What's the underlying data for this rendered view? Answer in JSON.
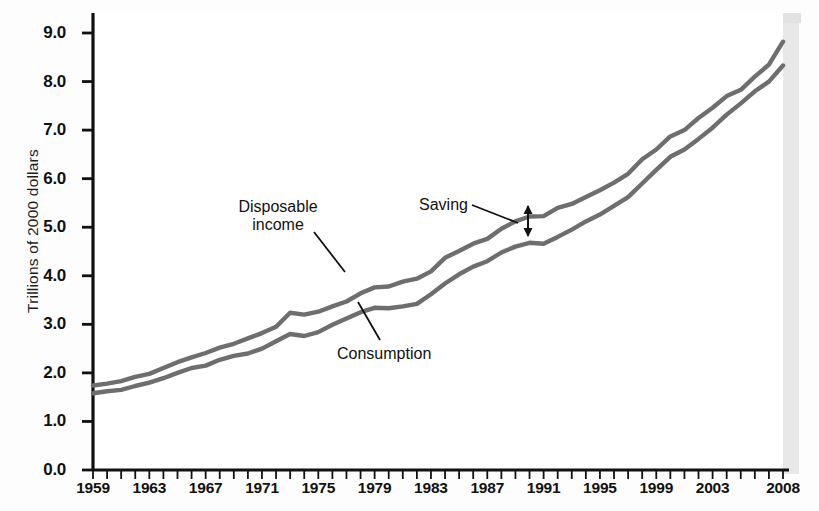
{
  "chart_data": {
    "type": "line",
    "title": "",
    "xlabel": "",
    "ylabel": "Trillions of 2000 dollars",
    "xlim": [
      1959,
      2008
    ],
    "ylim": [
      0.0,
      9.4
    ],
    "grid": false,
    "legend_position": "inline-annotations",
    "ytick_labels": [
      "0.0",
      "1.0",
      "2.0",
      "3.0",
      "4.0",
      "5.0",
      "6.0",
      "7.0",
      "8.0",
      "9.0"
    ],
    "ytick_values": [
      0.0,
      1.0,
      2.0,
      3.0,
      4.0,
      5.0,
      6.0,
      7.0,
      8.0,
      9.0
    ],
    "xtick_labels": [
      "1959",
      "1963",
      "1967",
      "1971",
      "1975",
      "1979",
      "1983",
      "1987",
      "1991",
      "1995",
      "1999",
      "2003",
      "2008"
    ],
    "xtick_values": [
      1959,
      1963,
      1967,
      1971,
      1975,
      1979,
      1983,
      1987,
      1991,
      1995,
      1999,
      2003,
      2008
    ],
    "x": [
      1959,
      1960,
      1961,
      1962,
      1963,
      1964,
      1965,
      1966,
      1967,
      1968,
      1969,
      1970,
      1971,
      1972,
      1973,
      1974,
      1975,
      1976,
      1977,
      1978,
      1979,
      1980,
      1981,
      1982,
      1983,
      1984,
      1985,
      1986,
      1987,
      1988,
      1989,
      1990,
      1991,
      1992,
      1993,
      1994,
      1995,
      1996,
      1997,
      1998,
      1999,
      2000,
      2001,
      2002,
      2003,
      2004,
      2005,
      2006,
      2007,
      2008
    ],
    "series": [
      {
        "name": "Disposable income",
        "color": "#6e6e6e",
        "values": [
          1.74,
          1.78,
          1.83,
          1.92,
          1.98,
          2.1,
          2.22,
          2.32,
          2.41,
          2.52,
          2.6,
          2.71,
          2.82,
          2.95,
          3.24,
          3.2,
          3.26,
          3.37,
          3.47,
          3.64,
          3.76,
          3.78,
          3.88,
          3.94,
          4.09,
          4.37,
          4.51,
          4.66,
          4.76,
          4.97,
          5.12,
          5.22,
          5.23,
          5.4,
          5.48,
          5.62,
          5.76,
          5.92,
          6.1,
          6.4,
          6.6,
          6.87,
          7.0,
          7.25,
          7.46,
          7.7,
          7.83,
          8.1,
          8.35,
          8.82
        ]
      },
      {
        "name": "Consumption",
        "color": "#6e6e6e",
        "values": [
          1.58,
          1.62,
          1.65,
          1.73,
          1.8,
          1.89,
          2.0,
          2.1,
          2.15,
          2.27,
          2.35,
          2.4,
          2.5,
          2.65,
          2.8,
          2.76,
          2.84,
          2.99,
          3.12,
          3.25,
          3.34,
          3.33,
          3.37,
          3.42,
          3.62,
          3.84,
          4.03,
          4.19,
          4.3,
          4.48,
          4.6,
          4.68,
          4.66,
          4.8,
          4.95,
          5.12,
          5.26,
          5.44,
          5.62,
          5.9,
          6.18,
          6.45,
          6.6,
          6.82,
          7.05,
          7.32,
          7.55,
          7.8,
          8.0,
          8.33
        ]
      }
    ],
    "annotations": [
      {
        "name": "disposable-income-label",
        "text_line1": "Disposable",
        "text_line2": "income",
        "points_to_series": "Disposable income"
      },
      {
        "name": "consumption-label",
        "text_line1": "Consumption",
        "text_line2": "",
        "points_to_series": "Consumption"
      },
      {
        "name": "saving-label",
        "text_line1": "Saving",
        "text_line2": "",
        "points_to_series": "gap between curves at 1990"
      }
    ]
  },
  "scan_artifacts": {
    "bleed_line1": "the gap between income and saving — a key macroeconomic",
    "bleed_line2": "would your spending change? economic stimulus payments"
  }
}
